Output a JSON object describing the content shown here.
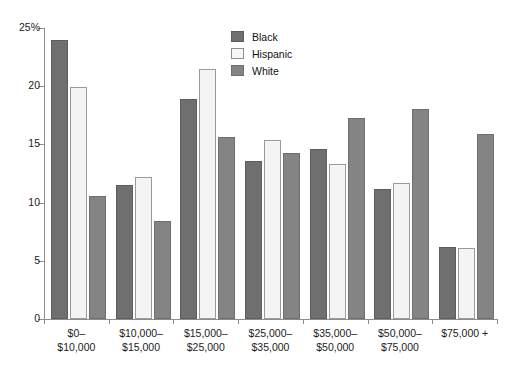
{
  "chart_data": {
    "type": "bar",
    "title": "",
    "xlabel": "",
    "ylabel": "",
    "ylim": [
      0,
      25
    ],
    "yticks": [
      0,
      5,
      10,
      15,
      20,
      25
    ],
    "ytick_labels": [
      "0",
      "5",
      "10",
      "15",
      "20",
      "25%"
    ],
    "grid": false,
    "legend_position": "top-center",
    "categories": [
      "$0–\n$10,000",
      "$10,000–\n$15,000",
      "$15,000–\n$25,000",
      "$25,000–\n$35,000",
      "$35,000–\n$50,000",
      "$50,000–\n$75,000",
      "$75,000 +"
    ],
    "series": [
      {
        "name": "Black",
        "color": "#6f6f6f",
        "values": [
          24.0,
          11.5,
          18.9,
          13.6,
          14.6,
          11.2,
          6.2
        ]
      },
      {
        "name": "Hispanic",
        "color": "#f4f4f4",
        "values": [
          19.9,
          12.2,
          21.5,
          15.4,
          13.3,
          11.7,
          6.1
        ]
      },
      {
        "name": "White",
        "color": "#848484",
        "values": [
          10.6,
          8.4,
          15.6,
          14.3,
          17.3,
          18.0,
          15.9
        ]
      }
    ]
  },
  "title_sliver": "",
  "legend": {
    "items": [
      {
        "label": "Black"
      },
      {
        "label": "Hispanic"
      },
      {
        "label": "White"
      }
    ]
  }
}
